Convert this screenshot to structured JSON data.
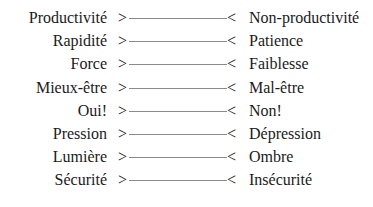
{
  "diagram": {
    "left_marker": ">",
    "right_marker": "<",
    "pairs": [
      {
        "left": "Productivité",
        "right": "Non-productivité"
      },
      {
        "left": "Rapidité",
        "right": "Patience"
      },
      {
        "left": "Force",
        "right": "Faiblesse"
      },
      {
        "left": "Mieux-être",
        "right": "Mal-être"
      },
      {
        "left": "Oui!",
        "right": "Non!"
      },
      {
        "left": "Pression",
        "right": "Dépression"
      },
      {
        "left": "Lumière",
        "right": "Ombre"
      },
      {
        "left": "Sécurité",
        "right": "Insécurité"
      }
    ]
  }
}
